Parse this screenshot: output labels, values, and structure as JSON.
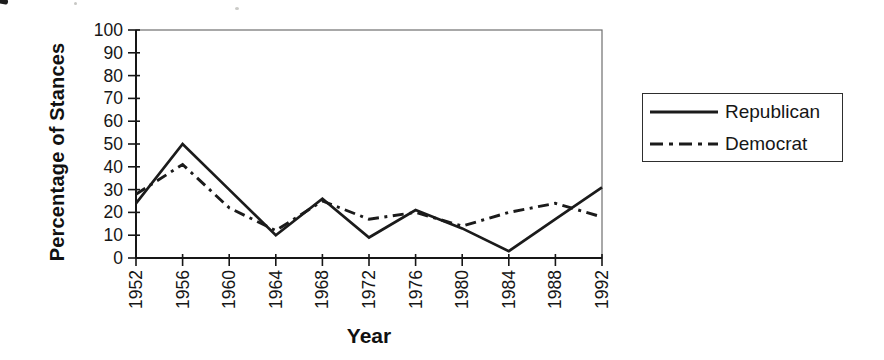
{
  "chart_data": {
    "type": "line",
    "title": "",
    "xlabel": "Year",
    "ylabel": "Percentage of Stances",
    "x": [
      1952,
      1956,
      1960,
      1964,
      1968,
      1972,
      1976,
      1980,
      1984,
      1988,
      1992
    ],
    "x_tick_labels": [
      "1952",
      "1956",
      "1960",
      "1964",
      "1968",
      "1972",
      "1976",
      "1980",
      "1984",
      "1988",
      "1992"
    ],
    "ylim": [
      0,
      100
    ],
    "ytick_step": 10,
    "y_tick_labels": [
      "0",
      "10",
      "20",
      "30",
      "40",
      "50",
      "60",
      "70",
      "80",
      "90",
      "100"
    ],
    "grid": false,
    "legend_position": "right-outside",
    "line_color": "#1b1b1b",
    "series": [
      {
        "name": "Republican",
        "line_style": "solid",
        "values": [
          24,
          50,
          30,
          10,
          26,
          9,
          21,
          13,
          3,
          17,
          31
        ]
      },
      {
        "name": "Democrat",
        "line_style": "dash-dot",
        "values": [
          28,
          41,
          22,
          12,
          25,
          17,
          20,
          14,
          20,
          24,
          18
        ]
      }
    ]
  }
}
